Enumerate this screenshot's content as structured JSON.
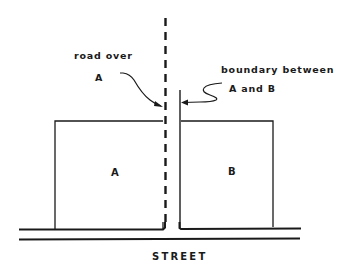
{
  "diagram": {
    "type": "plat-sketch",
    "colors": {
      "line": "#1a1a1a",
      "background": "#ffffff"
    },
    "annotations": {
      "road_label_line1": "road over",
      "road_label_line2": "A",
      "boundary_label_line1": "boundary between",
      "boundary_label_line2": "A and B"
    },
    "parcels": [
      {
        "id": "A",
        "label": "A"
      },
      {
        "id": "B",
        "label": "B"
      }
    ],
    "street": {
      "label": "STREET"
    },
    "legend_semantics": {
      "dashed_line": "road over A",
      "solid_line": "boundary between A and B"
    }
  }
}
